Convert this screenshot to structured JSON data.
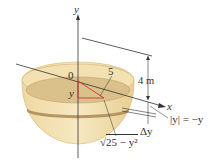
{
  "diagram": {
    "labels": {
      "y_axis": "y",
      "x_axis": "x",
      "origin": "0",
      "radius": "5",
      "depth": "4 m",
      "slice_y": "y",
      "delta_y": "Δy",
      "abs_y": "|y| = −y",
      "slice_radius_prefix": "√",
      "slice_radius": "25 − y²"
    },
    "colors": {
      "tank_fill": "#f1dca6",
      "tank_edge": "#c9a964",
      "water_fill": "#d9c08a",
      "slice_fill": "#b89a66",
      "axis": "#333333",
      "radius_line": "#cc3333"
    }
  }
}
